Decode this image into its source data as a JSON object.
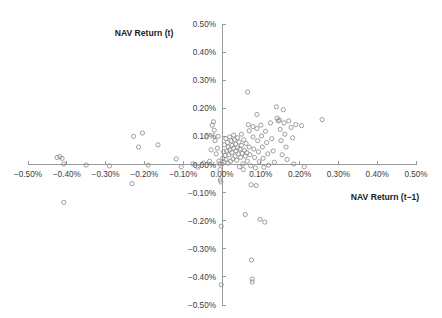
{
  "chart_data": {
    "type": "scatter",
    "title": "",
    "xlabel": "NAV Return (t−1)",
    "ylabel": "NAV Return (t)",
    "xlim": [
      -0.005,
      0.005
    ],
    "ylim": [
      -0.005,
      0.005
    ],
    "grid": false,
    "legend": null,
    "xticks": [
      -0.005,
      -0.004,
      -0.003,
      -0.002,
      -0.001,
      0,
      0.001,
      0.002,
      0.003,
      0.004,
      0.005
    ],
    "yticks": [
      -0.005,
      -0.004,
      -0.003,
      -0.002,
      -0.001,
      0,
      0.001,
      0.002,
      0.003,
      0.004,
      0.005
    ],
    "xticklabels": [
      "−0.50%",
      "−0.40%",
      "−0.30%",
      "−0.20%",
      "−0.10%",
      "0.00%",
      "0.10%",
      "0.20%",
      "0.30%",
      "0.40%",
      "0.50%"
    ],
    "yticklabels": [
      "−0.50%",
      "−0.40%",
      "−0.30%",
      "−0.20%",
      "−0.10%",
      "0.00%",
      "0.10%",
      "0.20%",
      "0.30%",
      "0.40%",
      "0.50%"
    ],
    "marker": "open-circle",
    "marker_color": "#8e8e8e",
    "axis_color": "#9a9a9a",
    "background": "#ffffff",
    "points": [
      [
        -0.00425,
        0.00025
      ],
      [
        -0.00418,
        0.00028
      ],
      [
        -0.00412,
        0.00022
      ],
      [
        -0.00408,
        -0.00135
      ],
      [
        -0.00408,
        2e-05
      ],
      [
        -0.0035,
        -2e-05
      ],
      [
        -0.0029,
        -5e-05
      ],
      [
        -0.00232,
        -0.00068
      ],
      [
        -0.00228,
        0.001
      ],
      [
        -0.00205,
        0.00112
      ],
      [
        -0.00215,
        0.00062
      ],
      [
        -0.0019,
        -2e-05
      ],
      [
        -0.00165,
        0.0007
      ],
      [
        -0.00118,
        0.0002
      ],
      [
        -0.00105,
        -8e-05
      ],
      [
        -0.00075,
        2e-05
      ],
      [
        -0.00062,
        -0.0001
      ],
      [
        -0.00048,
        5e-05
      ],
      [
        -0.0004,
        0.00098
      ],
      [
        -0.00032,
        0.00012
      ],
      [
        -0.00028,
        0.00052
      ],
      [
        -0.00025,
        0.0014
      ],
      [
        -0.00022,
        0.00152
      ],
      [
        -0.0002,
        0.00122
      ],
      [
        -0.00018,
        0.00085
      ],
      [
        -0.00015,
        0.00038
      ],
      [
        -0.00012,
        0.00058
      ],
      [
        -0.0001,
        0.001
      ],
      [
        -8e-05,
        0.00012
      ],
      [
        -6e-05,
        2e-05
      ],
      [
        -5e-05,
        -0.00018
      ],
      [
        -4e-05,
        -0.00055
      ],
      [
        -3e-05,
        -0.00062
      ],
      [
        -2e-05,
        -0.0022
      ],
      [
        -2e-05,
        -0.00428
      ],
      [
        0.0,
        2e-05
      ],
      [
        2e-05,
        0.00022
      ],
      [
        4e-05,
        0.00045
      ],
      [
        5e-05,
        8e-05
      ],
      [
        6e-05,
        0.0007
      ],
      [
        8e-05,
        0.00032
      ],
      [
        0.0001,
        0.00092
      ],
      [
        0.0001,
        0.00018
      ],
      [
        0.00012,
        0.00048
      ],
      [
        0.00014,
        0.00078
      ],
      [
        0.00015,
        5e-05
      ],
      [
        0.00016,
        0.00062
      ],
      [
        0.00018,
        0.00035
      ],
      [
        0.0002,
        0.00098
      ],
      [
        0.0002,
        0.00052
      ],
      [
        0.00022,
        0.00012
      ],
      [
        0.00024,
        0.00085
      ],
      [
        0.00025,
        0.00042
      ],
      [
        0.00026,
        0.00068
      ],
      [
        0.00028,
        0.0002
      ],
      [
        0.0003,
        0.00105
      ],
      [
        0.0003,
        0.00058
      ],
      [
        0.00032,
        0.00088
      ],
      [
        0.00034,
        0.0003
      ],
      [
        0.00035,
        0.00072
      ],
      [
        0.00036,
        0.00048
      ],
      [
        0.00038,
        0.00015
      ],
      [
        0.0004,
        0.00095
      ],
      [
        0.0004,
        0.0006
      ],
      [
        0.00042,
        0.00038
      ],
      [
        0.00044,
        0.0008
      ],
      [
        0.00045,
        -8e-05
      ],
      [
        0.00046,
        0.00055
      ],
      [
        0.00048,
        0.00025
      ],
      [
        0.0005,
        0.00108
      ],
      [
        0.0005,
        0.00068
      ],
      [
        0.00052,
        0.0004
      ],
      [
        0.00054,
        2e-05
      ],
      [
        0.00055,
        -0.00018
      ],
      [
        0.00056,
        0.00088
      ],
      [
        0.00058,
        0.0005
      ],
      [
        0.0006,
        0.0003
      ],
      [
        0.0006,
        -0.00178
      ],
      [
        0.00062,
        0.00075
      ],
      [
        0.00064,
        0.00042
      ],
      [
        0.00065,
        0.00012
      ],
      [
        0.00066,
        0.00258
      ],
      [
        0.00068,
        0.00142
      ],
      [
        0.0007,
        0.0012
      ],
      [
        0.0007,
        0.00062
      ],
      [
        0.00072,
        0.00035
      ],
      [
        0.00074,
        -5e-05
      ],
      [
        0.00075,
        -0.00072
      ],
      [
        0.00076,
        -0.0034
      ],
      [
        0.00078,
        -0.00408
      ],
      [
        0.00078,
        -0.00418
      ],
      [
        0.0008,
        0.00135
      ],
      [
        0.0008,
        0.00098
      ],
      [
        0.00082,
        0.00055
      ],
      [
        0.00084,
        0.00025
      ],
      [
        0.00086,
        -0.00012
      ],
      [
        0.00088,
        -0.00075
      ],
      [
        0.0009,
        0.00178
      ],
      [
        0.0009,
        0.00128
      ],
      [
        0.00092,
        0.00085
      ],
      [
        0.00094,
        0.00045
      ],
      [
        0.00096,
        0.0001
      ],
      [
        0.00098,
        -0.00195
      ],
      [
        0.001,
        0.0014
      ],
      [
        0.00102,
        0.00102
      ],
      [
        0.00104,
        0.00062
      ],
      [
        0.00106,
        0.00022
      ],
      [
        0.00108,
        -0.0001
      ],
      [
        0.0011,
        -0.00205
      ],
      [
        0.00112,
        0.00118
      ],
      [
        0.00115,
        0.00078
      ],
      [
        0.00118,
        0.00038
      ],
      [
        0.0012,
        -2e-05
      ],
      [
        0.00125,
        0.00148
      ],
      [
        0.00128,
        0.00092
      ],
      [
        0.00132,
        0.00048
      ],
      [
        0.00135,
        8e-05
      ],
      [
        0.0014,
        0.00205
      ],
      [
        0.00142,
        0.00165
      ],
      [
        0.00145,
        0.00155
      ],
      [
        0.00148,
        0.00158
      ],
      [
        0.0015,
        0.00125
      ],
      [
        0.00152,
        0.00085
      ],
      [
        0.00155,
        0.00035
      ],
      [
        0.00158,
        0.00195
      ],
      [
        0.0016,
        0.00148
      ],
      [
        0.00162,
        0.00108
      ],
      [
        0.00165,
        0.00062
      ],
      [
        0.00168,
        0.00018
      ],
      [
        0.00172,
        0.00155
      ],
      [
        0.00178,
        0.00132
      ],
      [
        0.00182,
        0.00095
      ],
      [
        0.00185,
        2e-05
      ],
      [
        0.0019,
        0.00142
      ],
      [
        0.00205,
        0.00138
      ],
      [
        0.00212,
        -8e-05
      ],
      [
        0.00258,
        0.0016
      ]
    ]
  }
}
